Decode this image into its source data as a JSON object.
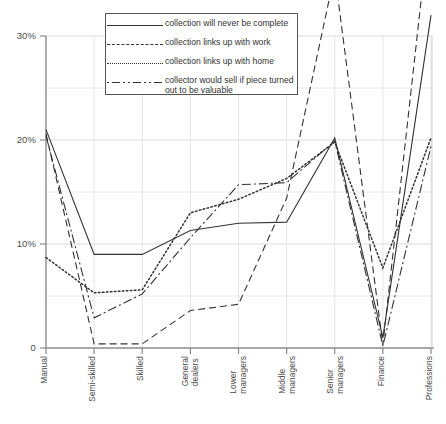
{
  "chart_data": {
    "type": "line",
    "title": "",
    "xlabel": "",
    "ylabel": "",
    "ylim": [
      0,
      30
    ],
    "ytick_labels": [
      "0",
      "10%",
      "20%",
      "30%"
    ],
    "ytick_values": [
      0,
      10,
      20,
      30
    ],
    "minor_gridlines": [
      5,
      15,
      25
    ],
    "grid": true,
    "legend_position": "top-center",
    "categories": [
      "Manual",
      "Semi-skilled",
      "Skilled",
      "General dealers",
      "Lower managers",
      "Middle managers",
      "Senior managers",
      "Finance",
      "Professions"
    ],
    "series": [
      {
        "name": "collection will never be complete",
        "style": "solid",
        "values": [
          21.0,
          9.0,
          9.0,
          11.3,
          12.0,
          12.1,
          20.2,
          1.0,
          32.0
        ]
      },
      {
        "name": "collection links up with work",
        "style": "dashed",
        "values": [
          20.6,
          0.4,
          0.4,
          3.6,
          4.2,
          14.4,
          36.0,
          0.3,
          42.0
        ]
      },
      {
        "name": "collection links up with home",
        "style": "dotted",
        "values": [
          8.7,
          5.3,
          5.6,
          13.0,
          14.3,
          16.3,
          19.8,
          7.7,
          20.2
        ]
      },
      {
        "name": "collector would sell if piece turned out to be valuable",
        "style": "dash-dot",
        "values": [
          20.4,
          2.9,
          5.2,
          10.6,
          15.7,
          15.9,
          19.9,
          0.2,
          19.4
        ]
      }
    ]
  },
  "axis": {
    "y_labels": [
      "30%",
      "20%",
      "10%",
      "0"
    ],
    "x_labels": [
      [
        "Manual"
      ],
      [
        "Semi-skilled"
      ],
      [
        "Skilled"
      ],
      [
        "General",
        "dealers"
      ],
      [
        "Lower",
        "managers"
      ],
      [
        "Middle",
        "managers"
      ],
      [
        "Senior",
        "managers"
      ],
      [
        "Finance"
      ],
      [
        "Professions"
      ]
    ]
  },
  "legend": {
    "items": [
      {
        "label": "collection will never be complete",
        "style": "solid"
      },
      {
        "label": "collection links up with work",
        "style": "dash"
      },
      {
        "label": "collection links up with home",
        "style": "dot"
      },
      {
        "label": "collector would sell if piece turned out to be valuable",
        "style": "dashdot"
      }
    ]
  },
  "colors": {
    "line": "#333333",
    "axis": "#8a8a8a",
    "grid": "#d9d9d9",
    "text": "#4a4a4a",
    "background": "#ffffff"
  }
}
